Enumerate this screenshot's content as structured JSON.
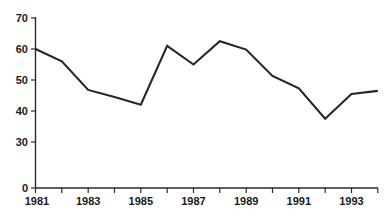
{
  "chart_data": {
    "type": "line",
    "title": "",
    "subtitle": "",
    "xlabel": "",
    "ylabel": "",
    "grid": false,
    "legend": false,
    "legend_position": "none",
    "line_color": "#262626",
    "axis_color": "#2b2b2b",
    "background": "#ffffff",
    "x": [
      1981,
      1982,
      1983,
      1984,
      1985,
      1986,
      1987,
      1988,
      1989,
      1990,
      1991,
      1992,
      1993,
      1994
    ],
    "values": [
      60.0,
      56.0,
      46.8,
      44.5,
      42.0,
      61.0,
      55.0,
      62.5,
      59.8,
      51.3,
      47.3,
      37.5,
      45.5,
      46.5
    ],
    "xlim": [
      1981,
      1994
    ],
    "ylim": [
      0,
      70
    ],
    "y_axis_broken": true,
    "y_break_between": [
      0,
      30
    ],
    "ytick_labels": [
      "70",
      "60",
      "50",
      "40",
      "30",
      "0"
    ],
    "ytick_values": [
      70,
      60,
      50,
      40,
      30,
      0
    ],
    "xtick_values": [
      1981,
      1982,
      1983,
      1984,
      1985,
      1986,
      1987,
      1988,
      1989,
      1990,
      1991,
      1992,
      1993,
      1994
    ],
    "xtick_labels": [
      "1981",
      "",
      "1983",
      "",
      "1985",
      "",
      "1987",
      "",
      "1989",
      "",
      "1991",
      "",
      "1993",
      ""
    ],
    "xtick_labels_shown": [
      "1981",
      "1983",
      "1985",
      "1987",
      "1989",
      "1991",
      "1993"
    ]
  },
  "footer": {
    "artifact_text": ""
  }
}
